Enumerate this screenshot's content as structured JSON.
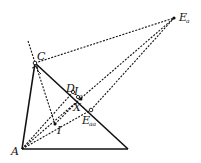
{
  "diagram": {
    "points": {
      "A": {
        "x": 22,
        "y": 149,
        "label": "A"
      },
      "B": {
        "x": 128,
        "y": 149,
        "label": ""
      },
      "C": {
        "x": 35,
        "y": 63,
        "label": "C"
      },
      "Ea": {
        "x": 174,
        "y": 18,
        "label": "E",
        "sub": "a"
      },
      "D": {
        "x": 73,
        "y": 92,
        "label": "D"
      },
      "Ia": {
        "x": 79,
        "y": 95,
        "label": "I",
        "sub": "a"
      },
      "X": {
        "x": 80,
        "y": 99,
        "label": "X"
      },
      "Eaa": {
        "x": 91,
        "y": 110,
        "label": "E",
        "sub": "aa"
      },
      "I": {
        "x": 55,
        "y": 124,
        "label": "I"
      }
    },
    "colors": {
      "stroke": "#111111",
      "background": "#ffffff"
    }
  }
}
